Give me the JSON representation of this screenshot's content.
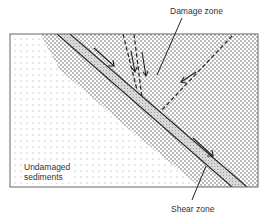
{
  "labels": {
    "damage_zone": "Damage zone",
    "undamaged_line1": "Undamaged",
    "undamaged_line2": "sediments",
    "shear_zone": "Shear zone"
  },
  "colors": {
    "line": "#222222",
    "frame": "#666666",
    "shear_fill": "#cfcfcf",
    "damage_dot": "#555555",
    "sediment_dot": "#9a9a9a"
  }
}
